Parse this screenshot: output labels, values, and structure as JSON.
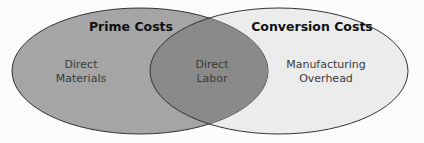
{
  "diagram": {
    "type": "venn",
    "sets": [
      {
        "name": "Prime Costs",
        "fill": "#a5a5a5"
      },
      {
        "name": "Conversion Costs",
        "fill": "#ececec"
      }
    ],
    "overlap_fill": "#8a8a8a",
    "regions": {
      "left_only": {
        "line1": "Direct",
        "line2": "Materials"
      },
      "overlap": {
        "line1": "Direct",
        "line2": "Labor"
      },
      "right_only": {
        "line1": "Manufacturing",
        "line2": "Overhead"
      }
    }
  }
}
